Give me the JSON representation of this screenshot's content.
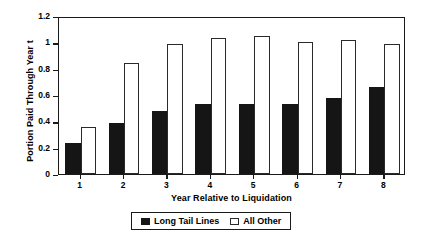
{
  "chart_data": {
    "type": "bar",
    "title": "",
    "xlabel": "Year Relative to Liquidation",
    "ylabel": "Portion Paid Through Year t",
    "categories": [
      "1",
      "2",
      "3",
      "4",
      "5",
      "6",
      "7",
      "8"
    ],
    "series": [
      {
        "name": "Long Tail Lines",
        "color": "#151515",
        "values": [
          0.235,
          0.39,
          0.48,
          0.53,
          0.53,
          0.53,
          0.575,
          0.66
        ]
      },
      {
        "name": "All Other",
        "color": "#ffffff",
        "values": [
          0.355,
          0.845,
          0.985,
          1.03,
          1.045,
          1.0,
          1.015,
          0.985
        ]
      }
    ],
    "ylim": [
      0,
      1.2
    ],
    "yticks": [
      "0",
      "0.2",
      "0.4",
      "0.6",
      "0.8",
      "1",
      "1.2"
    ],
    "ytick_values": [
      0,
      0.2,
      0.4,
      0.6,
      0.8,
      1.0,
      1.2
    ],
    "grid": false,
    "legend_position": "bottom-center"
  },
  "legend": {
    "items": [
      {
        "label": "Long Tail Lines",
        "style": "dark"
      },
      {
        "label": "All Other",
        "style": "light"
      }
    ]
  }
}
